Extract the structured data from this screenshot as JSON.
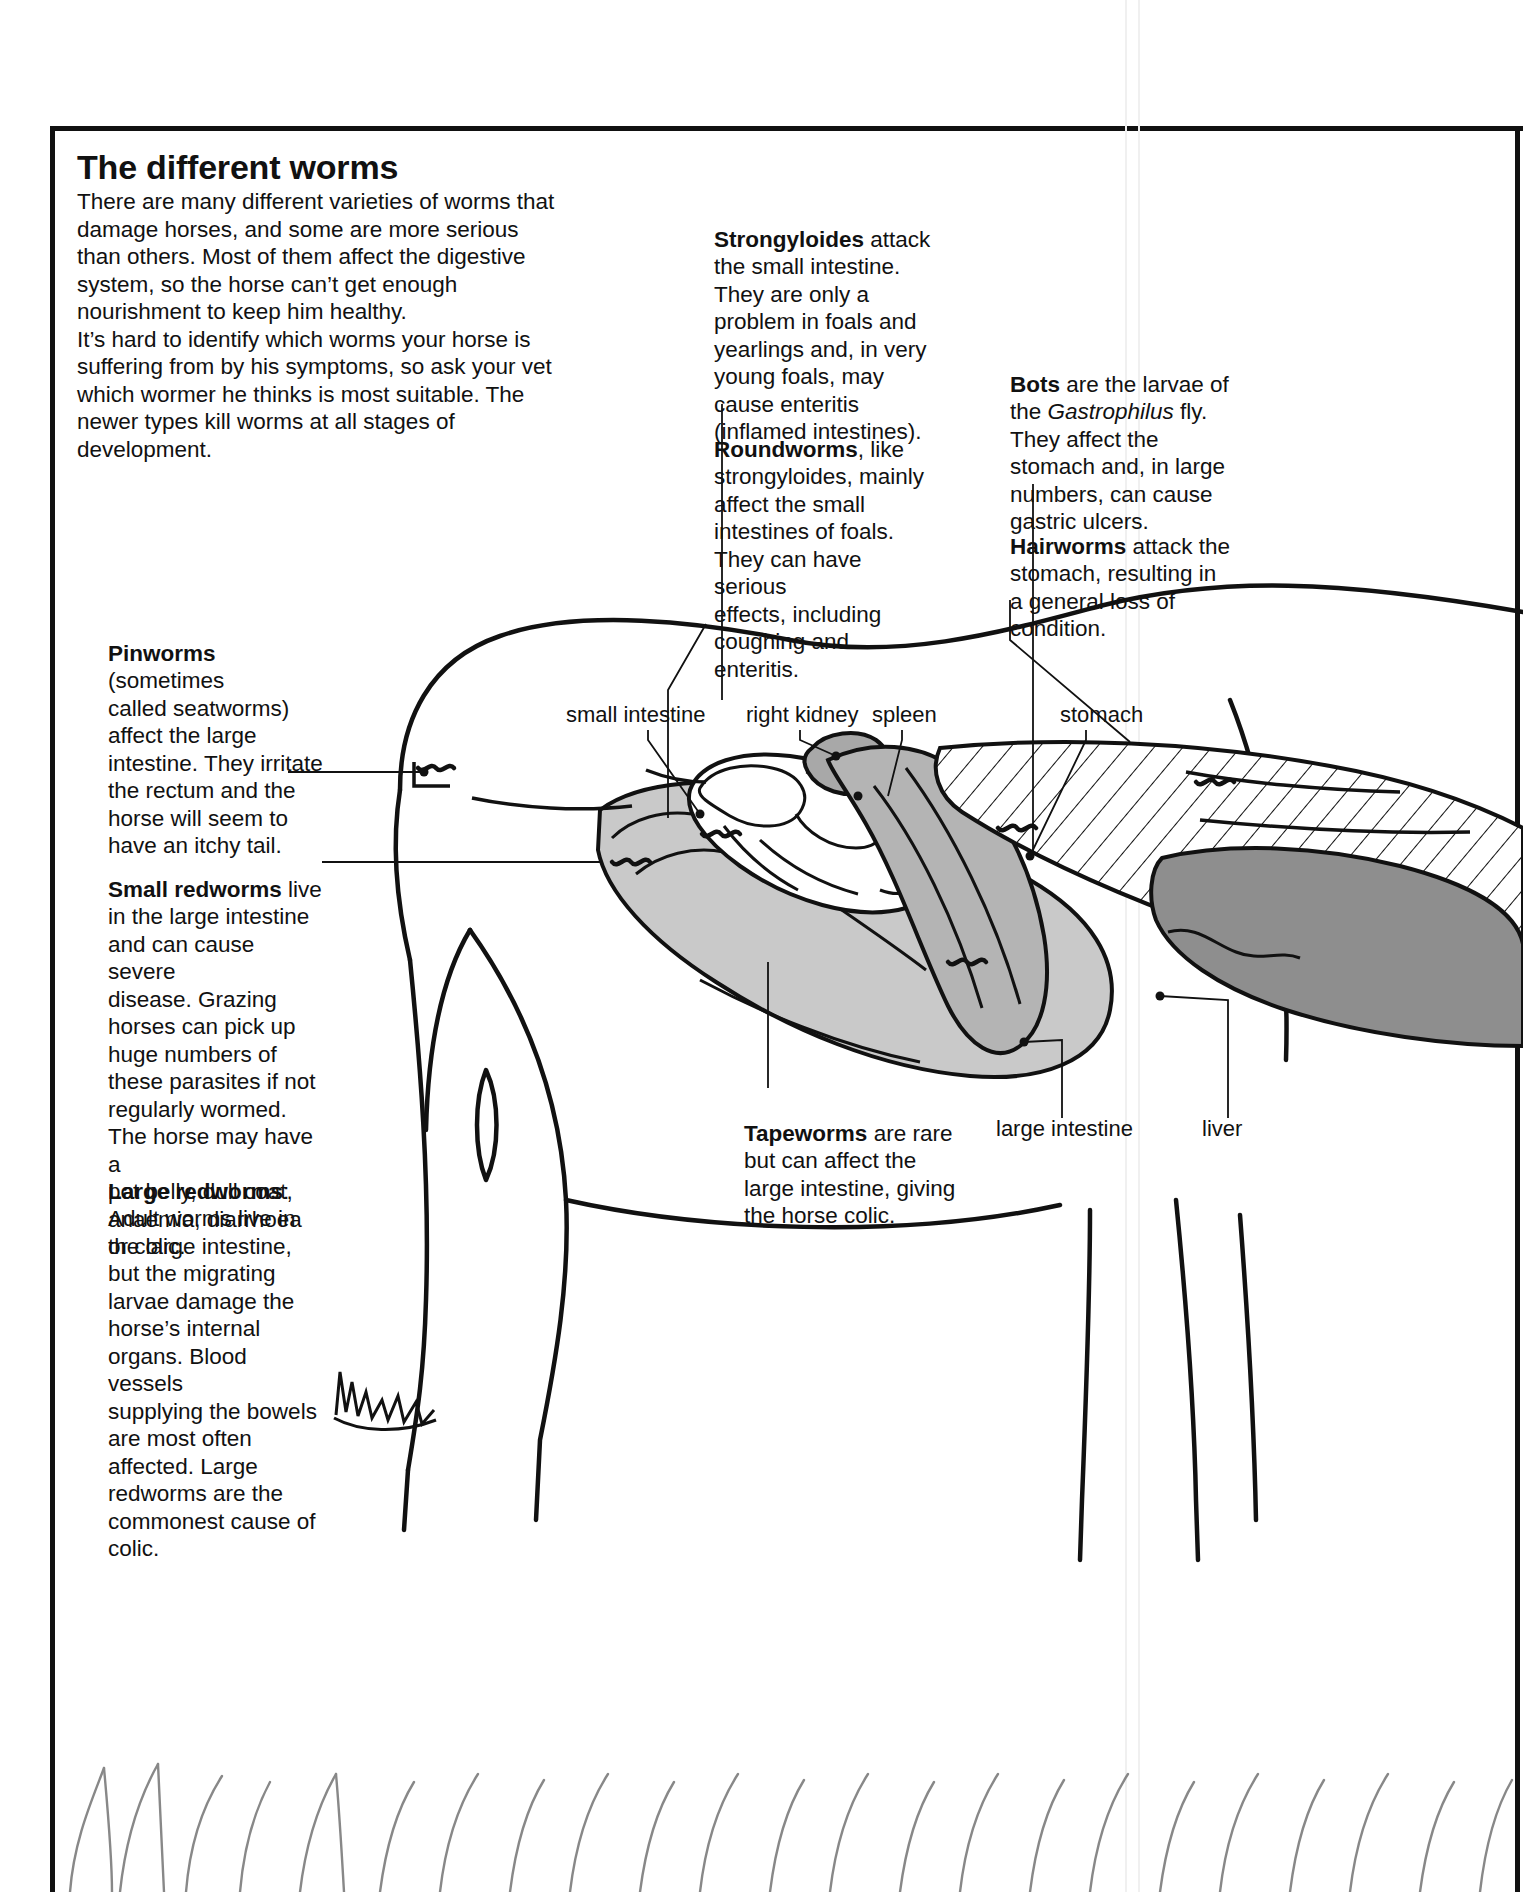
{
  "page": {
    "title": "The different worms",
    "intro": "There are many different varieties of worms that\ndamage horses, and some are more serious\nthan others. Most of them affect the digestive\nsystem, so the horse can’t get enough\nnourishment to keep him healthy.\n    It’s hard to identify which worms your horse is\nsuffering from by his symptoms, so ask your vet\nwhich wormer he thinks is most suitable. The\nnewer types kill worms at all stages of\ndevelopment."
  },
  "worms": {
    "pinworms": {
      "name": "Pinworms",
      "text": " (sometimes\ncalled seatworms)\naffect the large\nintestine. They irritate\nthe rectum and the\nhorse will seem to\nhave an itchy tail."
    },
    "small_redworms": {
      "name": "Small redworms",
      "text": " live\nin the large intestine\nand can cause severe\ndisease. Grazing\nhorses can pick up\nhuge numbers of\nthese parasites if not\nregularly wormed.\nThe horse may have a\npot belly, dull coat,\nanaemia, diarrhoea\nor colic."
    },
    "large_redworms": {
      "name": "Large redworms",
      "text": ":\nAdult worms live in\nthe large intestine,\nbut the migrating\nlarvae damage the\nhorse’s internal\norgans. Blood vessels\nsupplying the bowels\nare most often\naffected. Large\nredworms are the\ncommonest cause of\ncolic."
    },
    "strongyloides": {
      "name": "Strongyloides",
      "text": " attack\nthe small intestine.\nThey are only a\nproblem in foals and\nyearlings and, in very\nyoung foals, may\ncause enteritis\n(inflamed intestines)."
    },
    "roundworms": {
      "name": "Roundworms",
      "text": ", like\nstrongyloides, mainly\naffect the small\nintestines of foals.\nThey can have serious\neffects, including\ncoughing and\nenteritis."
    },
    "bots": {
      "name": "Bots",
      "text_before": " are the larvae of\nthe ",
      "species": "Gastrophilus",
      "text_after": " fly.\nThey affect the\nstomach and, in large\nnumbers, can cause\ngastric ulcers."
    },
    "hairworms": {
      "name": "Hairworms",
      "text": " attack the\nstomach, resulting in\na general loss of\ncondition."
    },
    "tapeworms": {
      "name": "Tapeworms",
      "text": " are rare\nbut can affect the\nlarge intestine, giving\nthe horse colic."
    }
  },
  "organ_labels": {
    "small_intestine": "small intestine",
    "right_kidney": "right kidney",
    "spleen": "spleen",
    "stomach": "stomach",
    "large_intestine": "large intestine",
    "liver": "liver"
  },
  "colors": {
    "ink": "#111111",
    "organ_light_grey": "#c9c9c9",
    "organ_mid_grey": "#b4b4b4",
    "organ_dark_grey": "#8e8e8e",
    "paper": "#ffffff"
  }
}
